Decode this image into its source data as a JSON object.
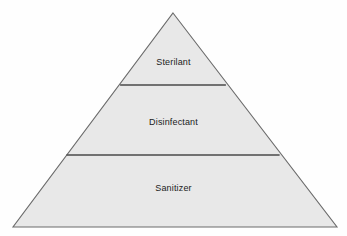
{
  "diagram": {
    "type": "pyramid",
    "shape_name": "antimicrobial-efficacy-pyramid",
    "background_color": "#fefefe",
    "fill_color": "#e8e8e8",
    "outline_color": "#6b6b6b",
    "divider_color": "#4a4a4a",
    "text_color": "#1b1b1b",
    "geometry": {
      "apex": [
        173,
        13
      ],
      "bottom_left": [
        13,
        227
      ],
      "bottom_right": [
        337,
        227
      ],
      "divider_top_y": 85,
      "divider_bottom_y": 155
    },
    "tiers": [
      {
        "id": "sterilant",
        "label": "Sterilant",
        "level": 1,
        "position": "top"
      },
      {
        "id": "disinfectant",
        "label": "Disinfectant",
        "level": 2,
        "position": "middle"
      },
      {
        "id": "sanitizer",
        "label": "Sanitizer",
        "level": 3,
        "position": "bottom"
      }
    ]
  }
}
